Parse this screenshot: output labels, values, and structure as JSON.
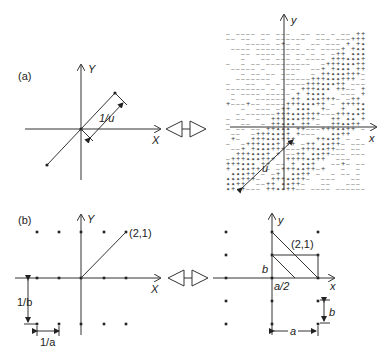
{
  "figure": {
    "panel_a": {
      "label": "(a)",
      "left": {
        "x_axis_label": "X",
        "y_axis_label": "Y",
        "dimension_label": "1/u"
      },
      "right": {
        "x_axis_label": "x",
        "y_axis_label": "y",
        "dimension_label": "u",
        "pattern_symbols": [
          "+",
          "-"
        ]
      }
    },
    "panel_b": {
      "label": "(b)",
      "left": {
        "x_axis_label": "X",
        "y_axis_label": "Y",
        "point_label": "(2,1)",
        "dim_vertical": "1/b",
        "dim_horizontal": "1/a"
      },
      "right": {
        "x_axis_label": "x",
        "y_axis_label": "y",
        "point_label": "(2,1)",
        "label_b_left": "b",
        "label_a_half": "a/2",
        "dim_vertical": "b",
        "dim_horizontal": "a"
      }
    },
    "transform_symbol": "double-arrow"
  }
}
